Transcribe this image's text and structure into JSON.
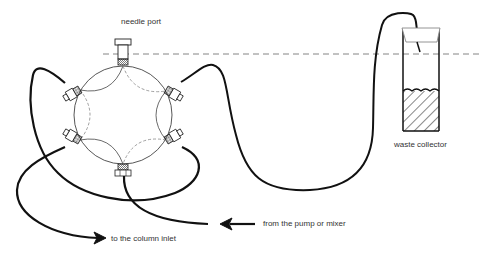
{
  "diagram": {
    "labels": {
      "needle_port": "needle port",
      "waste_collector": "waste collector",
      "from_pump": "from the pump or mixer",
      "to_column": "to the column inlet"
    },
    "components": [
      {
        "id": "rotary-valve",
        "type": "six-port valve",
        "ports": 6
      },
      {
        "id": "needle-port",
        "type": "port fitting"
      },
      {
        "id": "sample-loop",
        "type": "tubing loop"
      },
      {
        "id": "waste-collector",
        "type": "vial with liquid"
      },
      {
        "id": "liquid-level-line",
        "type": "dashed reference line"
      }
    ],
    "colors": {
      "line": "#111111",
      "thin_line": "#444444",
      "dashed": "#888888",
      "text": "#333333"
    }
  }
}
